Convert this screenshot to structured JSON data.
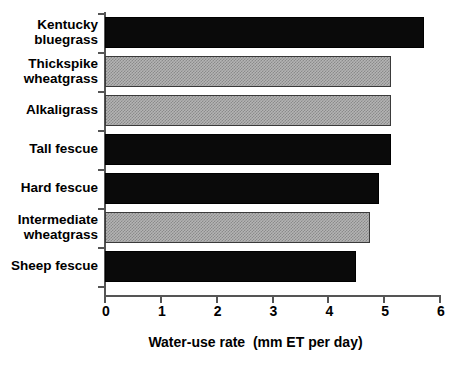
{
  "chart_data": {
    "type": "bar",
    "orientation": "horizontal",
    "title": "",
    "xlabel": "Water-use rate  (mm ET per day)",
    "ylabel": "",
    "xlim": [
      0,
      6
    ],
    "xticks": [
      "0",
      "1",
      "2",
      "3",
      "4",
      "5",
      "6"
    ],
    "grid": false,
    "legend": null,
    "categories": [
      "Kentucky bluegrass",
      "Thickspike wheatgrass",
      "Alkaligrass",
      "Tall fescue",
      "Hard fescue",
      "Intermediate wheatgrass",
      "Sheep fescue"
    ],
    "values": [
      5.72,
      5.12,
      5.12,
      5.12,
      4.9,
      4.75,
      4.5
    ],
    "bar_fills": [
      "black",
      "gray",
      "gray",
      "black",
      "black",
      "gray",
      "black"
    ],
    "colors": {
      "black_bar": "#0a0a0a",
      "gray_bar": "#b4b4b4",
      "axis": "#555555",
      "text": "#000000",
      "background": "#ffffff"
    },
    "bars": [
      {
        "label_lines": [
          "Kentucky",
          "bluegrass"
        ],
        "value": 5.72,
        "fill": "black"
      },
      {
        "label_lines": [
          "Thickspike",
          "wheatgrass"
        ],
        "value": 5.12,
        "fill": "gray"
      },
      {
        "label_lines": [
          "Alkaligrass"
        ],
        "value": 5.12,
        "fill": "gray"
      },
      {
        "label_lines": [
          "Tall fescue"
        ],
        "value": 5.12,
        "fill": "black"
      },
      {
        "label_lines": [
          "Hard fescue"
        ],
        "value": 4.9,
        "fill": "black"
      },
      {
        "label_lines": [
          "Intermediate",
          "wheatgrass"
        ],
        "value": 4.75,
        "fill": "gray"
      },
      {
        "label_lines": [
          "Sheep fescue"
        ],
        "value": 4.5,
        "fill": "black"
      }
    ]
  }
}
